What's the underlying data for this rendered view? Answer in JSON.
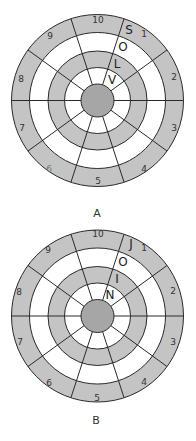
{
  "diagrams": [
    {
      "caption": "A",
      "center": [
        97.5,
        100.5
      ],
      "sector_numbers": [
        "10",
        "1",
        "2",
        "3",
        "4",
        "5",
        "6",
        "7",
        "8",
        "9"
      ],
      "letters": [
        "S",
        "O",
        "L",
        "V"
      ],
      "letter_sector": "1"
    },
    {
      "caption": "B",
      "center": [
        97.5,
        316
      ],
      "sector_numbers": [
        "10",
        "1",
        "2",
        "3",
        "4",
        "5",
        "6",
        "7",
        "8",
        "9"
      ],
      "letters": [
        "J",
        "O",
        "I",
        "N"
      ],
      "letter_sector": "1"
    }
  ],
  "rings": {
    "radii": [
      86,
      68,
      49.5,
      33,
      16.5
    ],
    "fills": [
      "gray",
      "white",
      "gray",
      "white",
      "gray"
    ]
  },
  "colors": {
    "ring_gray": "#c4c4c4",
    "hub_gray": "#a6a6a6",
    "line": "#2a2a2a"
  }
}
